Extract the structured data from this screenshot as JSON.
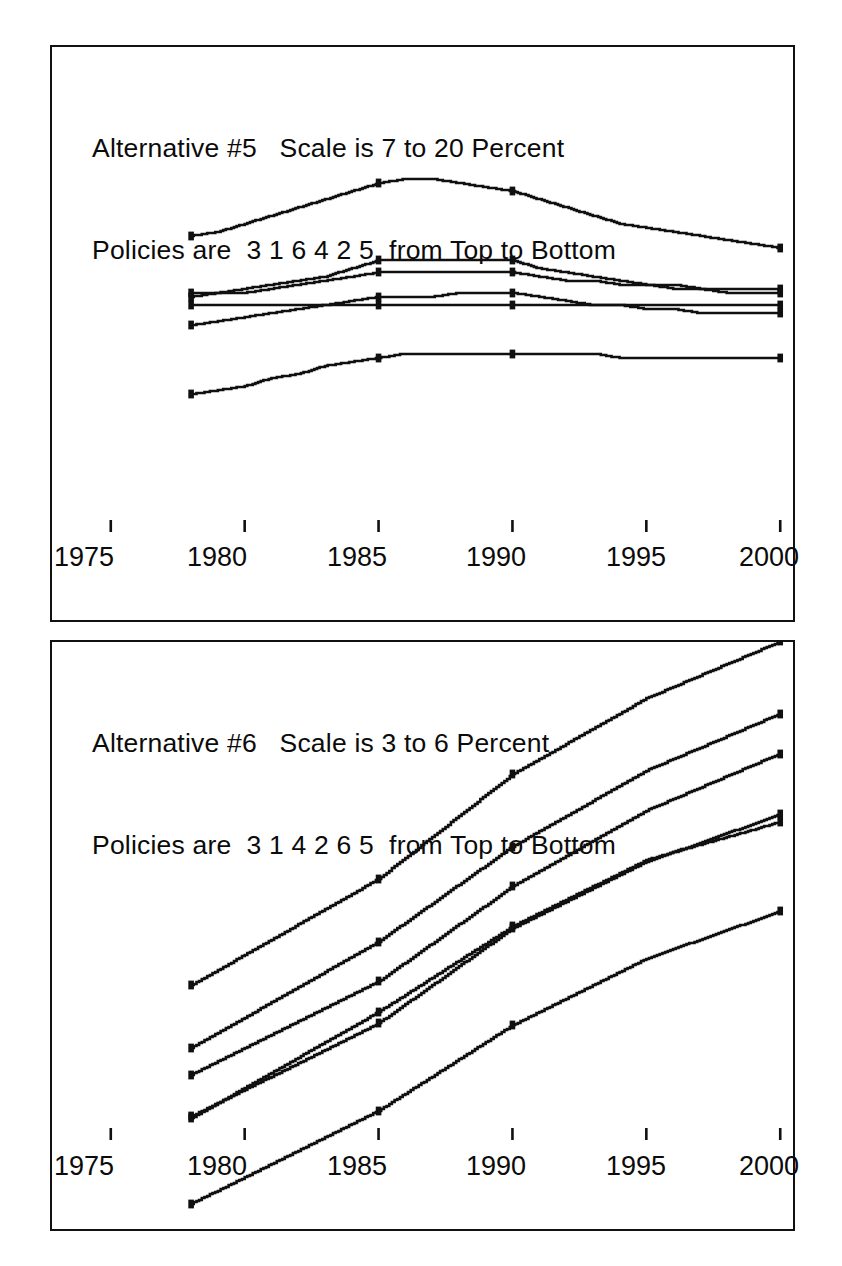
{
  "page": {
    "background": "#ffffff",
    "ink": "#101010",
    "width": 842,
    "height": 1266
  },
  "charts": [
    {
      "id": "alternative-5",
      "title_line1": "Alternative #5   Scale is 7 to 20 Percent",
      "title_line2": "Policies are  3 1 6 4 2 5  from Top to Bottom",
      "alternative_number": "5",
      "scale_min": "7",
      "scale_max": "20",
      "scale_units": "Percent",
      "policy_order_top_to_bottom": [
        "3",
        "1",
        "6",
        "4",
        "2",
        "5"
      ],
      "x_axis": {
        "labels": [
          "1975",
          "1980",
          "1985",
          "1990",
          "1995",
          "2000"
        ],
        "values": [
          1975,
          1980,
          1985,
          1990,
          1995,
          2000
        ],
        "min": 1974,
        "max": 2001
      },
      "y_axis": {
        "min": 7,
        "max": 20,
        "units": "Percent",
        "labels_shown": false,
        "major_tick_step": 1,
        "minor_tick_step": 0.5
      }
    },
    {
      "id": "alternative-6",
      "title_line1": "Alternative #6   Scale is 3 to 6 Percent",
      "title_line2": "Policies are  3 1 4 2 6 5  from Top to Bottom",
      "alternative_number": "6",
      "scale_min": "3",
      "scale_max": "6",
      "scale_units": "Percent",
      "policy_order_top_to_bottom": [
        "3",
        "1",
        "4",
        "2",
        "6",
        "5"
      ],
      "x_axis": {
        "labels": [
          "1975",
          "1980",
          "1985",
          "1990",
          "1995",
          "2000"
        ],
        "values": [
          1975,
          1980,
          1985,
          1990,
          1995,
          2000
        ],
        "min": 1974,
        "max": 2001
      },
      "y_axis": {
        "min": 3,
        "max": 6,
        "units": "Percent",
        "labels_shown": false,
        "major_tick_step": 0.25,
        "minor_tick_step": 0.125
      }
    }
  ],
  "chart_data": [
    {
      "type": "line",
      "title": "Alternative #5   Scale is 7 to 20 Percent",
      "subtitle": "Policies are  3 1 6 4 2 5  from Top to Bottom",
      "xlabel": "",
      "ylabel": "Percent",
      "xlim": [
        1974,
        2001
      ],
      "ylim": [
        7,
        20
      ],
      "grid": false,
      "legend": "none",
      "markers_at_x": [
        1978,
        1985,
        1990,
        2000
      ],
      "x": [
        1978,
        1979,
        1980,
        1981,
        1982,
        1983,
        1984,
        1985,
        1986,
        1987,
        1988,
        1989,
        1990,
        1991,
        1992,
        1993,
        1994,
        1995,
        1996,
        1997,
        1998,
        1999,
        2000
      ],
      "series": [
        {
          "name": "Policy 3",
          "position": "top",
          "values": [
            15.3,
            15.4,
            15.6,
            15.8,
            16.0,
            16.2,
            16.4,
            16.6,
            16.7,
            16.7,
            16.6,
            16.5,
            16.4,
            16.2,
            16.0,
            15.8,
            15.6,
            15.5,
            15.4,
            15.3,
            15.2,
            15.1,
            15.0
          ]
        },
        {
          "name": "Policy 1",
          "position": "second",
          "values": [
            13.9,
            13.9,
            14.0,
            14.1,
            14.2,
            14.3,
            14.5,
            14.7,
            14.7,
            14.7,
            14.7,
            14.7,
            14.7,
            14.5,
            14.4,
            14.3,
            14.2,
            14.1,
            14.1,
            14.0,
            14.0,
            14.0,
            14.0
          ]
        },
        {
          "name": "Policy 6",
          "position": "third",
          "values": [
            13.8,
            13.9,
            13.9,
            14.0,
            14.1,
            14.2,
            14.3,
            14.4,
            14.4,
            14.4,
            14.4,
            14.4,
            14.4,
            14.3,
            14.2,
            14.2,
            14.1,
            14.1,
            14.0,
            14.0,
            13.9,
            13.9,
            13.9
          ]
        },
        {
          "name": "Policy 4",
          "position": "fourth",
          "values": [
            13.6,
            13.6,
            13.6,
            13.6,
            13.6,
            13.6,
            13.6,
            13.6,
            13.6,
            13.6,
            13.6,
            13.6,
            13.6,
            13.6,
            13.6,
            13.6,
            13.6,
            13.6,
            13.6,
            13.6,
            13.6,
            13.6,
            13.6
          ]
        },
        {
          "name": "Policy 2",
          "position": "fifth",
          "values": [
            13.1,
            13.2,
            13.3,
            13.4,
            13.5,
            13.6,
            13.7,
            13.8,
            13.8,
            13.8,
            13.9,
            13.9,
            13.9,
            13.8,
            13.7,
            13.6,
            13.6,
            13.5,
            13.5,
            13.4,
            13.4,
            13.4,
            13.4
          ]
        },
        {
          "name": "Policy 5",
          "position": "bottom",
          "values": [
            11.4,
            11.5,
            11.6,
            11.8,
            11.9,
            12.1,
            12.2,
            12.3,
            12.4,
            12.4,
            12.4,
            12.4,
            12.4,
            12.4,
            12.4,
            12.4,
            12.3,
            12.3,
            12.3,
            12.3,
            12.3,
            12.3,
            12.3
          ]
        }
      ]
    },
    {
      "type": "line",
      "title": "Alternative #6   Scale is 3 to 6 Percent",
      "subtitle": "Policies are  3 1 4 2 6 5  from Top to Bottom",
      "xlabel": "",
      "ylabel": "Percent",
      "xlim": [
        1974,
        2001
      ],
      "ylim": [
        3,
        6
      ],
      "grid": false,
      "legend": "none",
      "markers_at_x": [
        1978,
        1985,
        1990,
        2000
      ],
      "x": [
        1978,
        1979,
        1980,
        1981,
        1982,
        1983,
        1984,
        1985,
        1986,
        1987,
        1988,
        1989,
        1990,
        1991,
        1992,
        1993,
        1994,
        1995,
        1996,
        1997,
        1998,
        1999,
        2000
      ],
      "series": [
        {
          "name": "Policy 3",
          "position": "top",
          "values": [
            4.13,
            4.21,
            4.29,
            4.37,
            4.45,
            4.53,
            4.61,
            4.69,
            4.8,
            4.91,
            5.02,
            5.13,
            5.24,
            5.32,
            5.4,
            5.48,
            5.56,
            5.64,
            5.7,
            5.76,
            5.82,
            5.88,
            5.94
          ]
        },
        {
          "name": "Policy 1",
          "position": "second",
          "values": [
            3.8,
            3.88,
            3.96,
            4.04,
            4.12,
            4.2,
            4.28,
            4.36,
            4.46,
            4.56,
            4.66,
            4.76,
            4.86,
            4.94,
            5.02,
            5.1,
            5.18,
            5.26,
            5.32,
            5.38,
            5.44,
            5.5,
            5.56
          ]
        },
        {
          "name": "Policy 4",
          "position": "third",
          "values": [
            3.66,
            3.73,
            3.8,
            3.87,
            3.94,
            4.01,
            4.08,
            4.15,
            4.25,
            4.35,
            4.45,
            4.55,
            4.65,
            4.73,
            4.81,
            4.89,
            4.97,
            5.05,
            5.11,
            5.17,
            5.23,
            5.29,
            5.35
          ]
        },
        {
          "name": "Policy 2",
          "position": "fourth",
          "values": [
            3.44,
            3.51,
            3.58,
            3.65,
            3.72,
            3.79,
            3.86,
            3.93,
            4.03,
            4.13,
            4.23,
            4.33,
            4.43,
            4.5,
            4.57,
            4.64,
            4.71,
            4.78,
            4.83,
            4.88,
            4.93,
            4.98,
            5.03
          ]
        },
        {
          "name": "Policy 6",
          "position": "fifth",
          "values": [
            3.43,
            3.51,
            3.59,
            3.67,
            3.75,
            3.83,
            3.91,
            3.99,
            4.08,
            4.17,
            4.26,
            4.35,
            4.44,
            4.51,
            4.58,
            4.65,
            4.72,
            4.79,
            4.83,
            4.87,
            4.91,
            4.95,
            4.99
          ]
        },
        {
          "name": "Policy 5",
          "position": "bottom",
          "values": [
            2.98,
            3.05,
            3.12,
            3.19,
            3.26,
            3.33,
            3.4,
            3.47,
            3.56,
            3.65,
            3.74,
            3.83,
            3.92,
            3.99,
            4.06,
            4.13,
            4.2,
            4.27,
            4.32,
            4.37,
            4.42,
            4.47,
            4.52
          ]
        }
      ]
    }
  ]
}
